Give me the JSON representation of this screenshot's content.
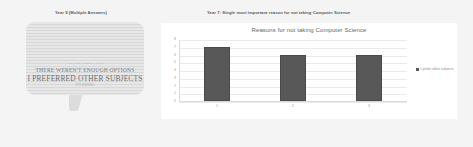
{
  "left_panel": {
    "title": "Year 9 (Multiple Answers)",
    "word_cloud": {
      "lines": [
        "IT'S TOO COMPLICATED",
        "THERE WEREN'T ENOUGH OPTIONS",
        "I PREFERRED OTHER SUBJECTS",
        "IT'S BORING"
      ]
    }
  },
  "right_panel": {
    "title": "Year 7: Single most important reason for not taking Computer Science"
  },
  "chart_data": {
    "type": "bar",
    "title": "Reasons for not taking Computer Science",
    "xlabel": "",
    "ylabel": "",
    "categories": [
      "1",
      "2",
      "3"
    ],
    "values": [
      7,
      6,
      6
    ],
    "ylim": [
      0,
      8
    ],
    "yticks": [
      "8",
      "7",
      "6",
      "5",
      "4",
      "3",
      "2",
      "1",
      "0"
    ],
    "grid": true,
    "legend_position": "right",
    "series": [
      {
        "name": "I prefer other subjects",
        "values": [
          7,
          6,
          6
        ]
      }
    ],
    "bar_color": "#585858",
    "plot_background": "#ffffff",
    "gridline_color": "#e9eaec"
  }
}
